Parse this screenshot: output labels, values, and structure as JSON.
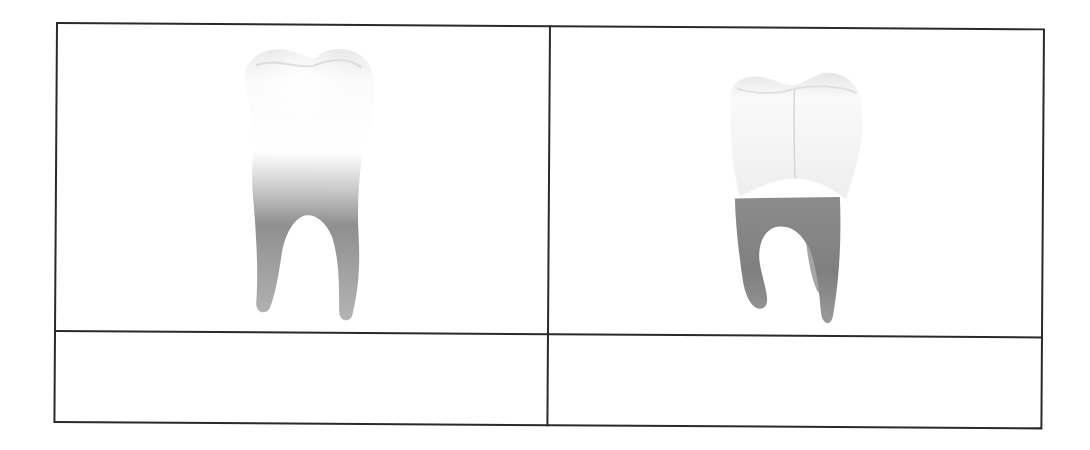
{
  "table": {
    "rows": 2,
    "columns": 2,
    "cells": [
      {
        "row": 0,
        "col": 0,
        "type": "image",
        "image": "molar-tooth-two-roots-icon",
        "label": ""
      },
      {
        "row": 0,
        "col": 1,
        "type": "image",
        "image": "molar-tooth-three-roots-icon",
        "label": ""
      },
      {
        "row": 1,
        "col": 0,
        "type": "text",
        "label": ""
      },
      {
        "row": 1,
        "col": 1,
        "type": "text",
        "label": ""
      }
    ]
  },
  "colors": {
    "border": "#2a2a2a",
    "crown": "#f7f7f7",
    "root": "#8a8a8a",
    "background": "#ffffff"
  }
}
